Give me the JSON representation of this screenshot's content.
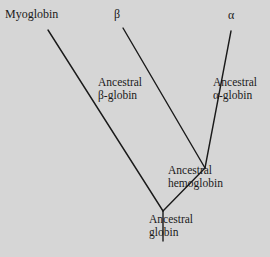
{
  "diagram": {
    "colors": {
      "background": "#d6d6d6",
      "line": "#1a1a1a",
      "text": "#1a1a1a"
    },
    "leaves": {
      "myoglobin": "Myoglobin",
      "beta": "β",
      "alpha": "α"
    },
    "branch_labels": {
      "ancestral_beta_globin": {
        "line1": "Ancestral",
        "line2": "β-globin"
      },
      "ancestral_alpha_globin": {
        "line1": "Ancestral",
        "line2": "α-globin"
      },
      "ancestral_hemoglobin": {
        "line1": "Ancestral",
        "line2": "hemoglobin"
      },
      "ancestral_globin": {
        "line1": "Ancestral",
        "line2": "globin"
      }
    },
    "edges": [
      {
        "from": "root-stem-bottom",
        "to": "ancestral-globin-node"
      },
      {
        "from": "ancestral-globin-node",
        "to": "myoglobin"
      },
      {
        "from": "ancestral-globin-node",
        "to": "ancestral-hemoglobin-node"
      },
      {
        "from": "ancestral-hemoglobin-node",
        "to": "beta"
      },
      {
        "from": "ancestral-hemoglobin-node",
        "to": "alpha"
      }
    ]
  }
}
